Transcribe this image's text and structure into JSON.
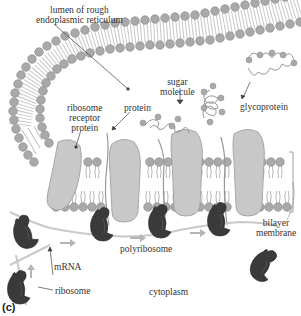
{
  "figure": {
    "panel_label": "(c)",
    "labels": {
      "lumen_line1": "lumen of rough",
      "lumen_line2": "endoplasmic reticulum",
      "sugar_line1": "sugar",
      "sugar_line2": "molecule",
      "glycoprotein": "glycoprotein",
      "ribo_rec_line1": "ribosome",
      "ribo_rec_line2": "receptor",
      "ribo_rec_line3": "protein",
      "protein": "protein",
      "bilayer_line1": "bilayer",
      "bilayer_line2": "membrane",
      "mrna": "mRNA",
      "polyribosome": "polyribosome",
      "ribosome": "ribosome",
      "cytoplasm": "cytoplasm"
    },
    "colors": {
      "lipid_head": "#a9a9a9",
      "lipid_tail": "#9a9a9a",
      "receptor_protein": "#c8c8c8",
      "ribosome": "#3a3a3a",
      "mrna": "#c9c9c9",
      "arrow": "#b5b5b5",
      "text": "#333333"
    }
  }
}
